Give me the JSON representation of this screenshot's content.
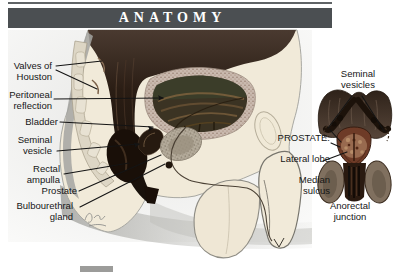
{
  "header": {
    "title": "ANATOMY"
  },
  "sagittal_figure": {
    "labels": {
      "valves_of_houston": "Valves of\nHouston",
      "peritoneal_reflection": "Peritoneal\nreflection",
      "bladder": "Bladder",
      "seminal_vesicle": "Seminal\nvesicle",
      "rectal_ampulla": "Rectal\nampulla",
      "prostate": "Prostate",
      "bulbourethral_gland": "Bulbourethral\ngland"
    }
  },
  "posterior_inset": {
    "labels": {
      "seminal_vesicles": "Seminal\nvesicles",
      "prostate_heading": "PROSTATE:",
      "lateral_lobe": "Lateral lobe",
      "median_sulcus": "Median\nsulcus",
      "anorectal_junction": "Anorectal\njunction"
    }
  },
  "colors": {
    "banner_bg": "#4b4f52",
    "banner_text": "#ffffff",
    "label_text": "#161616",
    "leader_line": "#141414",
    "body_fill": "#f1ead9",
    "dark_tissue": "#2a1d14",
    "bladder_wall": "#c9b9ae",
    "inset_prostate": "#6e3b27"
  }
}
